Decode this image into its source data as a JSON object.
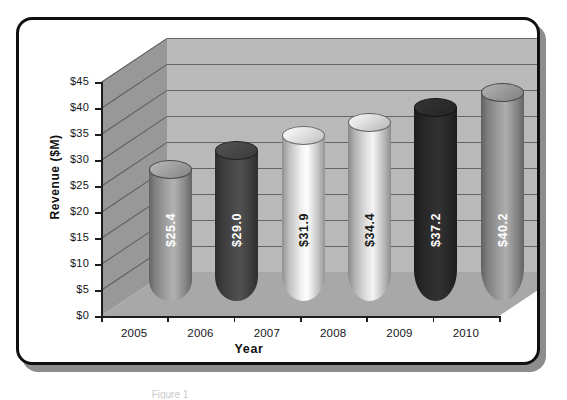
{
  "figure": {
    "frame_border_color": "#101010",
    "shadow_color": "#8d8d8d",
    "background": "#ffffff",
    "caption_partial": "Figure 1"
  },
  "chart_data": {
    "type": "bar",
    "render_style": "3d-cylinder",
    "title": "",
    "xlabel": "Year",
    "ylabel": "Revenue ($M)",
    "categories": [
      "2005",
      "2006",
      "2007",
      "2008",
      "2009",
      "2010"
    ],
    "values": [
      25.4,
      29.0,
      31.9,
      34.4,
      37.2,
      40.2
    ],
    "data_labels": [
      "$25.4",
      "$29.0",
      "$31.9",
      "$34.4",
      "$37.2",
      "$40.2"
    ],
    "ylim": [
      0,
      45
    ],
    "ytick_step": 5,
    "ytick_labels": [
      "$45",
      "$40",
      "$35",
      "$30",
      "$25",
      "$20",
      "$15",
      "$10",
      "$5",
      "$0"
    ],
    "ytick_values": [
      45,
      40,
      35,
      30,
      25,
      20,
      15,
      10,
      5,
      0
    ],
    "grid": true,
    "legend": false,
    "bar_colors": [
      "#a5a5a5",
      "#4a4a4a",
      "#efefef",
      "#e2e2e2",
      "#2e2e2e",
      "#a0a0a0"
    ],
    "bar_label_colors": [
      "#ffffff",
      "#ffffff",
      "#1a1a1a",
      "#1a1a1a",
      "#ffffff",
      "#ffffff"
    ],
    "scene": {
      "back_wall_color": "#b9b9b9",
      "side_wall_color": "#989898",
      "floor_color": "#a8a8a8",
      "gridline_color": "#55555f",
      "axis_color": "#1d1d1d"
    }
  }
}
